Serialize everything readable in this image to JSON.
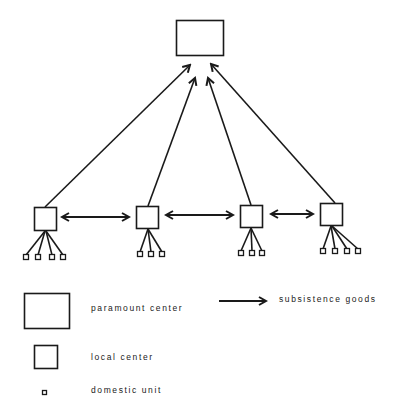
{
  "diagram": {
    "colors": {
      "stroke": "#1a1a1a",
      "background": "#ffffff"
    },
    "paramount_center": {
      "label": "paramount center",
      "x": 176,
      "y": 20,
      "w": 47,
      "h": 35
    },
    "local_centers": [
      {
        "id": "lc1",
        "x": 34,
        "y": 207,
        "w": 23,
        "h": 24,
        "domestic_units": [
          25,
          37,
          51,
          62
        ],
        "du_y": 255
      },
      {
        "id": "lc2",
        "x": 136,
        "y": 206,
        "w": 23,
        "h": 23,
        "domestic_units": [
          139,
          150,
          161
        ],
        "du_y": 252
      },
      {
        "id": "lc3",
        "x": 240,
        "y": 205,
        "w": 23,
        "h": 23,
        "domestic_units": [
          240,
          251,
          261
        ],
        "du_y": 251
      },
      {
        "id": "lc4",
        "x": 320,
        "y": 203,
        "w": 23,
        "h": 23,
        "domestic_units": [
          322,
          334,
          346,
          357
        ],
        "du_y": 249
      }
    ],
    "tribute_arrows": [
      {
        "from": [
          45,
          207
        ],
        "to": [
          190,
          65
        ]
      },
      {
        "from": [
          148,
          206
        ],
        "to": [
          195,
          78
        ]
      },
      {
        "from": [
          251,
          205
        ],
        "to": [
          208,
          78
        ]
      },
      {
        "from": [
          335,
          203
        ],
        "to": [
          211,
          64
        ]
      }
    ],
    "exchange_arrows": [
      {
        "from": [
          61,
          217
        ],
        "to": [
          130,
          217
        ]
      },
      {
        "from": [
          165,
          215
        ],
        "to": [
          234,
          215
        ]
      },
      {
        "from": [
          270,
          214
        ],
        "to": [
          314,
          214
        ]
      }
    ]
  },
  "legend": {
    "paramount_center": "paramount center",
    "local_center": "local center",
    "domestic_unit": "domestic unit",
    "subsistence_goods": "subsistence goods"
  }
}
